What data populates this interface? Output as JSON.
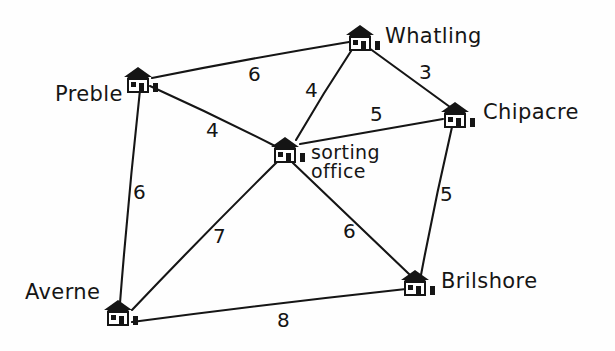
{
  "diagram": {
    "ink_color": "#151515",
    "background_color": "#fefefe"
  },
  "nodes": [
    {
      "id": "preble",
      "label": "Preble",
      "icon": "house-icon",
      "x": 138,
      "y": 80,
      "label_x": 55,
      "label_y": 84,
      "lines": [
        "Preble"
      ]
    },
    {
      "id": "whatling",
      "label": "Whatling",
      "icon": "house-icon",
      "x": 360,
      "y": 38,
      "label_x": 385,
      "label_y": 26,
      "lines": [
        "Whatling"
      ]
    },
    {
      "id": "chipacre",
      "label": "Chipacre",
      "icon": "house-icon",
      "x": 455,
      "y": 115,
      "label_x": 483,
      "label_y": 102,
      "lines": [
        "Chipacre"
      ]
    },
    {
      "id": "sorting",
      "label": "sorting office",
      "icon": "house-icon",
      "x": 285,
      "y": 150,
      "label_x": 311,
      "label_y": 143,
      "lines": [
        "sorting",
        "office"
      ]
    },
    {
      "id": "averne",
      "label": "Averne",
      "icon": "house-icon",
      "x": 118,
      "y": 313,
      "label_x": 25,
      "label_y": 282,
      "lines": [
        "Averne"
      ]
    },
    {
      "id": "brilshore",
      "label": "Brilshore",
      "icon": "house-icon",
      "x": 415,
      "y": 283,
      "label_x": 441,
      "label_y": 271,
      "lines": [
        "Brilshore"
      ]
    }
  ],
  "edges": [
    {
      "id": "preble-whatling",
      "from": "preble",
      "to": "whatling",
      "weight": "6",
      "x1": 152,
      "y1": 78,
      "x2": 349,
      "y2": 42,
      "label_x": 248,
      "label_y": 62
    },
    {
      "id": "whatling-chipacre",
      "from": "whatling",
      "to": "chipacre",
      "weight": "3",
      "x1": 369,
      "y1": 48,
      "x2": 450,
      "y2": 107,
      "label_x": 419,
      "label_y": 60
    },
    {
      "id": "whatling-sorting",
      "from": "whatling",
      "to": "sorting",
      "weight": "4",
      "x1": 353,
      "y1": 48,
      "x2": 296,
      "y2": 140,
      "label_x": 305,
      "label_y": 78
    },
    {
      "id": "preble-sorting",
      "from": "preble",
      "to": "sorting",
      "weight": "4",
      "x1": 150,
      "y1": 86,
      "x2": 275,
      "y2": 146,
      "label_x": 206,
      "label_y": 118
    },
    {
      "id": "sorting-chipacre",
      "from": "sorting",
      "to": "chipacre",
      "weight": "5",
      "x1": 300,
      "y1": 144,
      "x2": 443,
      "y2": 119,
      "label_x": 370,
      "label_y": 102
    },
    {
      "id": "preble-averne",
      "from": "preble",
      "to": "averne",
      "weight": "6",
      "x1": 140,
      "y1": 90,
      "x2": 120,
      "y2": 303,
      "label_x": 133,
      "label_y": 180
    },
    {
      "id": "averne-sorting",
      "from": "averne",
      "to": "sorting",
      "weight": "7",
      "x1": 132,
      "y1": 310,
      "x2": 277,
      "y2": 162,
      "label_x": 213,
      "label_y": 224
    },
    {
      "id": "sorting-brilshore",
      "from": "sorting",
      "to": "brilshore",
      "weight": "6",
      "x1": 293,
      "y1": 163,
      "x2": 409,
      "y2": 274,
      "label_x": 343,
      "label_y": 219
    },
    {
      "id": "chipacre-brilshore",
      "from": "chipacre",
      "to": "brilshore",
      "weight": "5",
      "x1": 452,
      "y1": 127,
      "x2": 421,
      "y2": 275,
      "label_x": 440,
      "label_y": 182
    },
    {
      "id": "averne-brilshore",
      "from": "averne",
      "to": "brilshore",
      "weight": "8",
      "x1": 132,
      "y1": 322,
      "x2": 406,
      "y2": 289,
      "label_x": 277,
      "label_y": 308
    }
  ]
}
